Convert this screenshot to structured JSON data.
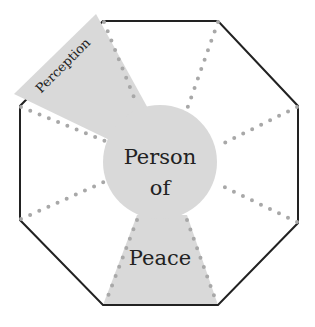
{
  "diagram": {
    "center_label_line1": "Person",
    "center_label_line2": "of",
    "bottom_label": "Peace",
    "wedge_label": "Perception",
    "colors": {
      "fill": "#d9d9d9",
      "outline": "#222222",
      "dots": "#a8a8a8"
    }
  }
}
